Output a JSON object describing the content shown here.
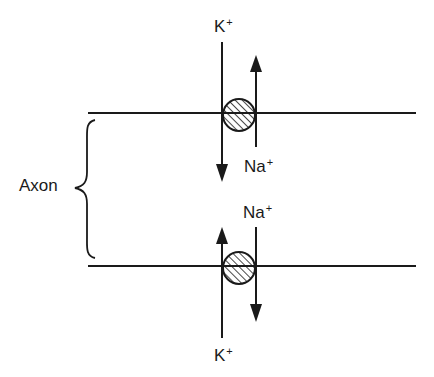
{
  "diagram": {
    "colors": {
      "ink": "#1a1a1a",
      "background": "#ffffff"
    },
    "region_label": "Axon",
    "membranes": [
      {
        "id": "upper",
        "y": 113
      },
      {
        "id": "lower",
        "y": 266
      }
    ],
    "channels": [
      {
        "membrane": "upper",
        "flows": [
          {
            "ion": "K",
            "charge": "+",
            "direction": "down",
            "label_position": "top"
          },
          {
            "ion": "Na",
            "charge": "+",
            "direction": "up",
            "label_position": "bottom"
          }
        ]
      },
      {
        "membrane": "lower",
        "flows": [
          {
            "ion": "Na",
            "charge": "+",
            "direction": "down",
            "label_position": "top"
          },
          {
            "ion": "K",
            "charge": "+",
            "direction": "up",
            "label_position": "bottom"
          }
        ]
      }
    ],
    "labels": {
      "k_top": "K",
      "k_top_charge": "+",
      "na_mid_upper": "Na",
      "na_mid_upper_charge": "+",
      "na_mid_lower": "Na",
      "na_mid_lower_charge": "+",
      "k_bottom": "K",
      "k_bottom_charge": "+",
      "axon": "Axon"
    }
  }
}
